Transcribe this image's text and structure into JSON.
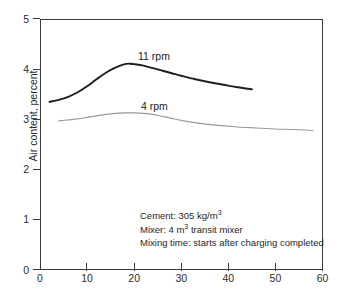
{
  "chart_data": {
    "type": "line",
    "title": "",
    "subtitle": "",
    "xlabel": "",
    "ylabel": "Air content, percent",
    "xlim": [
      0,
      60
    ],
    "ylim": [
      0,
      5
    ],
    "xticks": [
      "0",
      "10",
      "20",
      "30",
      "40",
      "50",
      "60"
    ],
    "yticks": [
      "0",
      "1",
      "2",
      "3",
      "4",
      "5"
    ],
    "grid": false,
    "legend_position": "inline-curve-labels",
    "series": [
      {
        "name": "11 rpm",
        "color": "#1d1d1d",
        "x": [
          2,
          4,
          6,
          8,
          10,
          12,
          14,
          16,
          18,
          19,
          20,
          22,
          24,
          26,
          28,
          30,
          33,
          36,
          39,
          42,
          45
        ],
        "y": [
          3.35,
          3.39,
          3.45,
          3.54,
          3.66,
          3.8,
          3.93,
          4.03,
          4.1,
          4.11,
          4.1,
          4.07,
          4.02,
          3.97,
          3.92,
          3.87,
          3.8,
          3.74,
          3.69,
          3.64,
          3.6
        ]
      },
      {
        "name": "4 rpm",
        "color": "#9a9a9a",
        "x": [
          4,
          6,
          8,
          10,
          12,
          14,
          16,
          18,
          19,
          20,
          22,
          24,
          26,
          28,
          30,
          34,
          38,
          42,
          46,
          50,
          54,
          58
        ],
        "y": [
          2.97,
          2.99,
          3.01,
          3.04,
          3.07,
          3.1,
          3.12,
          3.13,
          3.13,
          3.13,
          3.12,
          3.1,
          3.06,
          3.02,
          2.98,
          2.92,
          2.88,
          2.85,
          2.83,
          2.81,
          2.8,
          2.78
        ]
      }
    ],
    "annotations": [
      {
        "label": "Cement: 305 kg/m",
        "sup": "3",
        "tail": ""
      },
      {
        "label": "Mixer: 4 m",
        "sup": "3",
        "tail": " transit mixer"
      },
      {
        "label": "Mixing time: starts after charging completed",
        "sup": "",
        "tail": ""
      }
    ],
    "colors": {
      "axis": "#3a3a3a",
      "text": "#262626",
      "series_11rpm": "#1d1d1d",
      "series_4rpm": "#9a9a9a",
      "background": "#ffffff"
    }
  }
}
